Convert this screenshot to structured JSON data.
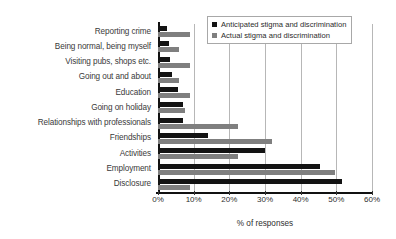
{
  "chart_data": {
    "type": "bar",
    "orientation": "horizontal",
    "title": "",
    "xlabel": "% of responses",
    "ylabel": "",
    "xlim": [
      0,
      60
    ],
    "xticks": [
      0,
      10,
      20,
      30,
      40,
      50,
      60
    ],
    "xtick_labels": [
      "0%",
      "10%",
      "20%",
      "30%",
      "40%",
      "50%",
      "60%"
    ],
    "grid": "vertical",
    "legend_position": "top-right",
    "categories": [
      "Reporting crime",
      "Being normal, being myself",
      "Visiting pubs, shops etc.",
      "Going out and about",
      "Education",
      "Going on holiday",
      "Relationships with professionals",
      "Friendships",
      "Activities",
      "Employment",
      "Disclosure"
    ],
    "series": [
      {
        "name": "Anticipated stigma and discrimination",
        "color": "#131313",
        "values": [
          2.5,
          3.0,
          3.5,
          4.0,
          5.5,
          7.0,
          7.0,
          14.0,
          30.0,
          45.5,
          51.5
        ]
      },
      {
        "name": "Actual stigma and discrimination",
        "color": "#7f7f7f",
        "values": [
          9.0,
          6.0,
          9.0,
          6.0,
          9.0,
          7.5,
          22.5,
          32.0,
          22.5,
          49.5,
          9.0
        ]
      }
    ]
  },
  "legend": {
    "items": [
      {
        "label": "Anticipated stigma and discrimination"
      },
      {
        "label": "Actual stigma and discrimination"
      }
    ]
  }
}
